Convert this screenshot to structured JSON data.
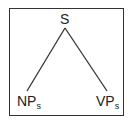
{
  "tree": {
    "root": {
      "label": "S"
    },
    "children": [
      {
        "label": "NP",
        "subscript": "s"
      },
      {
        "label": "VP",
        "subscript": "s"
      }
    ]
  },
  "colors": {
    "line": "#333333",
    "text": "#222222",
    "background": "#ffffff"
  }
}
